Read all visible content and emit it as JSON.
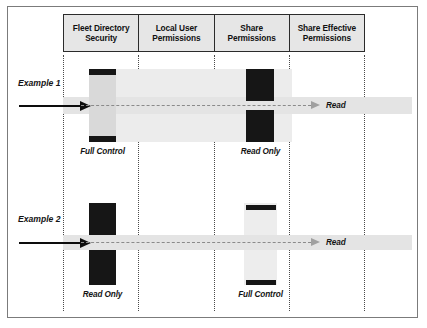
{
  "diagram": {
    "columns": [
      {
        "id": "fleet-directory-security",
        "label": "Fleet Directory\nSecurity"
      },
      {
        "id": "local-user-permissions",
        "label": "Local User\nPermissions"
      },
      {
        "id": "share-permissions",
        "label": "Share\nPermissions"
      },
      {
        "id": "share-effective-permissions",
        "label": "Share Effective\nPermissions"
      }
    ],
    "rows": [
      {
        "id": "example-1",
        "label": "Example 1",
        "fleet_directory_security": "Full Control",
        "local_user_permissions": "",
        "share_permissions": "Read Only",
        "share_effective_permissions": "Read"
      },
      {
        "id": "example-2",
        "label": "Example 2",
        "fleet_directory_security": "Read Only",
        "local_user_permissions": "",
        "share_permissions": "Full Control",
        "share_effective_permissions": "Read"
      }
    ],
    "colors": {
      "frame_border": "#7b7b7b",
      "header_fill": "#e6e6e6",
      "header_border": "#2b2b2b",
      "bar_dark": "#161616",
      "bar_light": "#d9d9d9",
      "band_light": "#ececec",
      "flow_line": "#8a8a8a",
      "flow_arrow": "#a0a0a0",
      "input_arrow": "#0d0d0d",
      "guide_dotted": "#4a4a4a",
      "text": "#141414"
    }
  },
  "header": {
    "col1": "Fleet Directory Security",
    "col1_line1": "Fleet Directory",
    "col1_line2": "Security",
    "col2_line1": "Local User",
    "col2_line2": "Permissions",
    "col3_line1": "Share",
    "col3_line2": "Permissions",
    "col4_line1": "Share Effective",
    "col4_line2": "Permissions"
  },
  "example1": {
    "row_label": "Example 1",
    "fleet_caption": "Full Control",
    "share_caption": "Read Only",
    "result_label": "Read"
  },
  "example2": {
    "row_label": "Example 2",
    "fleet_caption": "Read Only",
    "share_caption": "Full Control",
    "result_label": "Read"
  }
}
